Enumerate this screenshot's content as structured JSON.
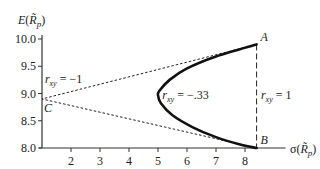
{
  "chart_data": {
    "type": "line",
    "title": "",
    "xlabel": "σ(R̃p)",
    "ylabel": "E(R̃p)",
    "xlim": [
      1,
      9.5
    ],
    "ylim": [
      8.0,
      10.0
    ],
    "x_ticks": [
      "2",
      "3",
      "4",
      "5",
      "6",
      "7",
      "8"
    ],
    "y_ticks": [
      "10.0",
      "9.5",
      "9.0",
      "8.5",
      "8.0"
    ],
    "grid": false,
    "points": {
      "A": {
        "label": "A",
        "x": 8.4,
        "y": 9.9
      },
      "B": {
        "label": "B",
        "x": 8.4,
        "y": 8.0
      },
      "C": {
        "label": "C",
        "x": 1.0,
        "y": 8.9
      }
    },
    "series": [
      {
        "name": "r_xy = -1",
        "style": "dotted",
        "points": [
          [
            8.4,
            9.9
          ],
          [
            1.0,
            8.9
          ],
          [
            8.4,
            8.0
          ]
        ]
      },
      {
        "name": "r_xy = 1",
        "style": "dashed",
        "points": [
          [
            8.4,
            9.9
          ],
          [
            8.4,
            8.0
          ]
        ]
      },
      {
        "name": "r_xy = -.33",
        "style": "solid-bold",
        "points": [
          [
            8.4,
            9.9
          ],
          [
            7.0,
            9.68
          ],
          [
            6.0,
            9.46
          ],
          [
            5.4,
            9.25
          ],
          [
            5.05,
            9.05
          ],
          [
            5.0,
            8.97
          ],
          [
            5.1,
            8.82
          ],
          [
            5.5,
            8.6
          ],
          [
            6.2,
            8.38
          ],
          [
            7.0,
            8.2
          ],
          [
            7.8,
            8.07
          ],
          [
            8.4,
            8.0
          ]
        ]
      }
    ],
    "annotations": [
      {
        "text_r": "r",
        "sub": "xy",
        "rest": " = -1",
        "x": 1.1,
        "y": 9.27
      },
      {
        "text_r": "r",
        "sub": "xy",
        "rest": " = -.33",
        "x": 5.15,
        "y": 8.97
      },
      {
        "text_r": "r",
        "sub": "xy",
        "rest": " = 1",
        "x": 8.55,
        "y": 8.97
      }
    ]
  }
}
